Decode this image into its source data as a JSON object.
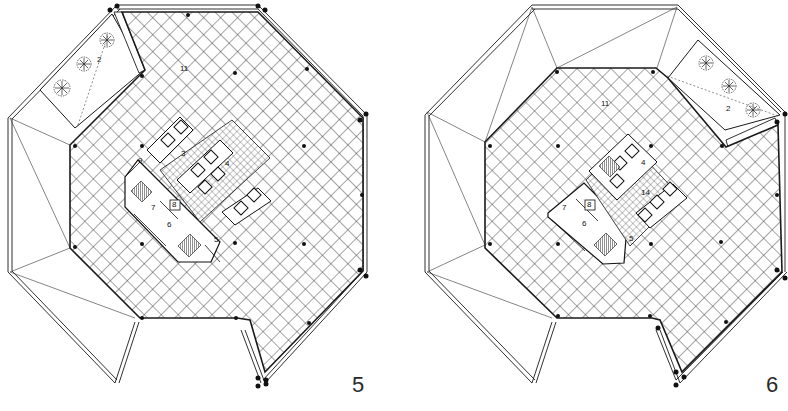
{
  "figure": {
    "type": "architectural floor plans",
    "panels": [
      {
        "id": "plan-5",
        "number": "5",
        "room_labels": [
          {
            "text": "2",
            "x": 100,
            "y": 61
          },
          {
            "text": "11",
            "x": 183,
            "y": 70
          },
          {
            "text": "3",
            "x": 183,
            "y": 155
          },
          {
            "text": "4",
            "x": 227,
            "y": 164
          },
          {
            "text": "9",
            "x": 140,
            "y": 162
          },
          {
            "text": "7",
            "x": 153,
            "y": 209
          },
          {
            "text": "8",
            "x": 174,
            "y": 206
          },
          {
            "text": "6",
            "x": 169,
            "y": 226
          },
          {
            "text": "5",
            "x": 216,
            "y": 241
          }
        ]
      },
      {
        "id": "plan-6",
        "number": "6",
        "room_labels": [
          {
            "text": "2",
            "x": 728,
            "y": 110
          },
          {
            "text": "11",
            "x": 603,
            "y": 104
          },
          {
            "text": "4",
            "x": 643,
            "y": 164
          },
          {
            "text": "14",
            "x": 644,
            "y": 194
          },
          {
            "text": "7",
            "x": 564,
            "y": 208
          },
          {
            "text": "8",
            "x": 589,
            "y": 206
          },
          {
            "text": "6",
            "x": 584,
            "y": 225
          },
          {
            "text": "5",
            "x": 631,
            "y": 240
          }
        ]
      }
    ],
    "colors": {
      "line": "#1a1a1a",
      "hatch": "#3a3a3a",
      "background": "#ffffff"
    }
  }
}
